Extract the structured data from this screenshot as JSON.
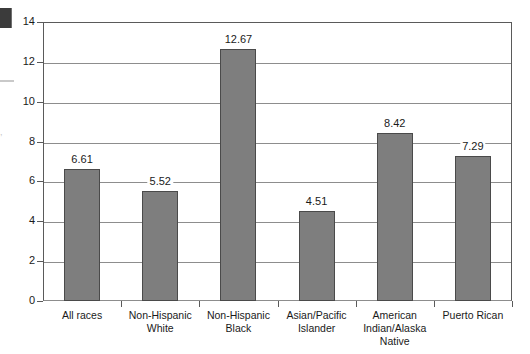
{
  "chart_data": {
    "type": "bar",
    "title": "",
    "subtitle": "",
    "xlabel": "",
    "ylabel": "",
    "categories": [
      "All races",
      "Non-Hispanic White",
      "Non-Hispanic Black",
      "Asian/Pacific Islander",
      "American Indian/Alaska Native",
      "Puerto Rican"
    ],
    "category_lines": [
      [
        "All races"
      ],
      [
        "Non-Hispanic",
        "White"
      ],
      [
        "Non-Hispanic",
        "Black"
      ],
      [
        "Asian/Pacific",
        "Islander"
      ],
      [
        "American",
        "Indian/Alaska",
        "Native"
      ],
      [
        "Puerto Rican"
      ]
    ],
    "values": [
      6.61,
      5.52,
      12.67,
      4.51,
      8.42,
      7.29
    ],
    "value_labels": [
      "6.61",
      "5.52",
      "12.67",
      "4.51",
      "8.42",
      "7.29"
    ],
    "ylim": [
      0,
      14
    ],
    "ytick_values": [
      0,
      2,
      4,
      6,
      8,
      10,
      12,
      14
    ],
    "ytick_labels": [
      "0",
      "2",
      "4",
      "6",
      "8",
      "10",
      "12",
      "14"
    ],
    "grid": true,
    "grid_axis": "y",
    "legend": false,
    "legend_position": "none",
    "bar_color": "#7e7e7e",
    "bar_edge_color": "#4a4a4a",
    "axis_color": "#5a5a5a",
    "grid_color": "#8d8d8d",
    "background_color": "#ffffff"
  },
  "artifacts": {
    "left_block_color": "#3b3b3b",
    "left_rule_color": "#c9c9c9",
    "left_glyph_text": ","
  }
}
